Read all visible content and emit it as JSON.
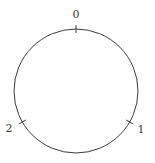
{
  "figure": {
    "type": "circle-diagram",
    "width": 155,
    "height": 163,
    "background_color": "#ffffff",
    "stroke_color": "#3c3c3c",
    "text_color": "#3c3c3c",
    "circle": {
      "center_x": 76,
      "center_y": 91,
      "radius": 62,
      "stroke_width": 1
    },
    "tick": {
      "inner_extent": 4,
      "outer_extent": 4,
      "stroke_width": 1
    }
  },
  "chart_data": {
    "type": "scatter",
    "title": "",
    "xlabel": "",
    "ylabel": "",
    "grid": false,
    "legend": false,
    "axis_visible": false,
    "shape": "circle",
    "point_count": 3,
    "angles_deg": [
      90,
      -30,
      210
    ],
    "labels": [
      "0",
      "1",
      "2"
    ],
    "points": [
      {
        "label": "0",
        "angle_deg": 90,
        "point_x": 76,
        "point_y": 29,
        "label_x": 76,
        "label_y": 14
      },
      {
        "label": "1",
        "angle_deg": -30,
        "point_x": 130,
        "point_y": 122,
        "label_x": 141,
        "label_y": 129
      },
      {
        "label": "2",
        "angle_deg": 210,
        "point_x": 22,
        "point_y": 122,
        "label_x": 9,
        "label_y": 128
      }
    ]
  }
}
